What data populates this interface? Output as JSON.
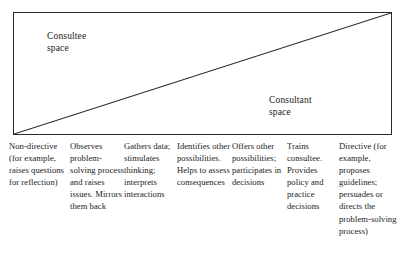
{
  "diagram": {
    "name": "consultee-consultant-continuum",
    "border_color": "#2b2b2b",
    "diagonal_color": "#2b2b2b",
    "background_color": "#ffffff",
    "upper_region_label": "Consultee\nspace",
    "lower_region_label": "Consultant\nspace",
    "upper_region_label_line1": "Consultee",
    "upper_region_label_line2": "space",
    "lower_region_label_line1": "Consultant",
    "lower_region_label_line2": "space"
  },
  "continuum": {
    "columns": [
      {
        "id": "non-directive",
        "text": "Non-directive (for example, raises questions for reflection)"
      },
      {
        "id": "observes",
        "text": "Observes problem-solving process and raises issues. Mirrors them back"
      },
      {
        "id": "gathers-data",
        "text": "Gathers data; stimulates thinking; interprets interactions"
      },
      {
        "id": "identifies-possibilities",
        "text": "Identifies other possibilities. Helps to assess consequences"
      },
      {
        "id": "offers-possibilities",
        "text": "Offers other possibilities; participates in decisions"
      },
      {
        "id": "trains-consultee",
        "text": "Trains consultee. Provides policy and practice decisions"
      },
      {
        "id": "directive",
        "text": "Directive (for example, proposes guidelines; persuades or directs the problem-solving process)"
      }
    ]
  }
}
